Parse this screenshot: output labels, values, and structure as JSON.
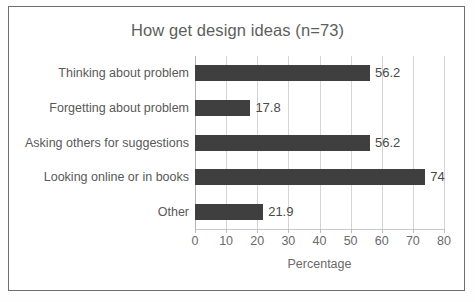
{
  "chart_data": {
    "type": "bar",
    "orientation": "horizontal",
    "title": "How get design ideas (n=73)",
    "xlabel": "Percentage",
    "ylabel": "",
    "categories": [
      "Thinking about problem",
      "Forgetting about problem",
      "Asking others for suggestions",
      "Looking online or in books",
      "Other"
    ],
    "values": [
      56.2,
      17.8,
      56.2,
      74,
      21.9
    ],
    "value_labels": [
      "56.2",
      "17.8",
      "56.2",
      "74",
      "21.9"
    ],
    "xlim": [
      0,
      80
    ],
    "xticks": [
      0,
      10,
      20,
      30,
      40,
      50,
      60,
      70,
      80
    ],
    "xtick_labels": [
      "0",
      "10",
      "20",
      "30",
      "40",
      "50",
      "60",
      "70",
      "80"
    ],
    "grid": "vertical",
    "legend": "none",
    "sample_size": 73,
    "colors": {
      "bar": "#3f3f3f",
      "gridline": "#d4d4d4",
      "title_text": "#5e5e5e",
      "label_text": "#595959",
      "tick_text": "#6a6a6a",
      "frame_border": "#6f6f72",
      "background": "#ffffff"
    }
  }
}
